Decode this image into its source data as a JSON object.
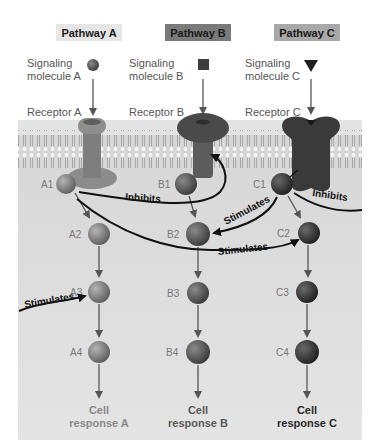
{
  "pathways": [
    {
      "id": "A",
      "header": "Pathway A",
      "header_color": "#e6e6e6",
      "molecule_line1": "Signaling",
      "molecule_line2": "molecule A",
      "molecule_shape": "circle",
      "receptor": "Receptor A",
      "nodes": [
        "A1",
        "A2",
        "A3",
        "A4"
      ],
      "response_line1": "Cell",
      "response_line2": "response A",
      "response_color": "#8a8a8a"
    },
    {
      "id": "B",
      "header": "Pathway B",
      "header_color": "#7a7a7a",
      "molecule_line1": "Signaling",
      "molecule_line2": "molecule B",
      "molecule_shape": "square",
      "receptor": "Receptor B",
      "nodes": [
        "B1",
        "B2",
        "B3",
        "B4"
      ],
      "response_line1": "Cell",
      "response_line2": "response B",
      "response_color": "#5a5a5a"
    },
    {
      "id": "C",
      "header": "Pathway C",
      "header_color": "#a8a8a8",
      "molecule_line1": "Signaling",
      "molecule_line2": "molecule C",
      "molecule_shape": "triangle",
      "receptor": "Receptor C",
      "nodes": [
        "C1",
        "C2",
        "C3",
        "C4"
      ],
      "response_line1": "Cell",
      "response_line2": "response C",
      "response_color": "#2a2a2a"
    }
  ],
  "interactions": [
    {
      "from": "A1",
      "to": "Receptor B",
      "type": "Inhibits"
    },
    {
      "from": "A1",
      "to": "C2",
      "type": "Stimulates"
    },
    {
      "from": "C1",
      "to": "B2",
      "type": "Stimulates"
    },
    {
      "from": "C1",
      "to": "right-edge",
      "type": "Inhibits"
    },
    {
      "from": "left-edge",
      "to": "A3",
      "type": "Stimulates"
    }
  ],
  "labels": {
    "inhibits": "Inhibits",
    "stimulates": "Stimulates"
  }
}
